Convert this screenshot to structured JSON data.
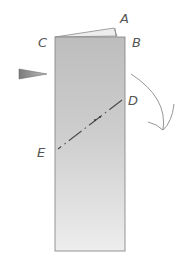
{
  "diagram": {
    "type": "origami-fold-instruction",
    "labels": {
      "A": "A",
      "B": "B",
      "C": "C",
      "D": "D",
      "E": "E"
    },
    "colors": {
      "paper_fill": "#c8c8c8",
      "paper_light": "#ececec",
      "outline": "#8a8a8a",
      "arrow": "#6e6e6e",
      "fold_line": "#4a4a4a",
      "label": "#555555"
    },
    "elements": [
      {
        "kind": "folded-paper-strip",
        "description": "Tall shaded vertical rectangle with top flap"
      },
      {
        "kind": "fold-line",
        "from": "D",
        "to": "E",
        "style": "dash-dot"
      },
      {
        "kind": "push-arrow",
        "direction": "right",
        "position": "left-side"
      },
      {
        "kind": "curved-arrow",
        "direction": "down-right",
        "position": "right-side"
      }
    ]
  }
}
